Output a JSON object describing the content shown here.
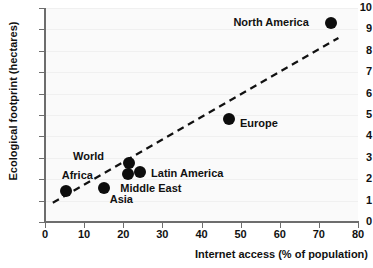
{
  "chart_data": {
    "type": "scatter",
    "title": "",
    "xlabel": "Internet access (% of population)",
    "ylabel": "Ecological footprint (hectares)",
    "xlim": [
      0,
      80
    ],
    "ylim": [
      0,
      10
    ],
    "xticks": [
      0,
      10,
      20,
      30,
      40,
      50,
      60,
      70,
      80
    ],
    "yticks": [
      0,
      1,
      2,
      3,
      4,
      5,
      6,
      7,
      8,
      9,
      10
    ],
    "grid": "horizontal-faint",
    "legend": "none",
    "point_color": "#0d0d0d",
    "trendline": {
      "style": "dashed",
      "color": "#111111",
      "x": [
        2.0,
        75.0
      ],
      "y": [
        0.9,
        8.6
      ]
    },
    "points": [
      {
        "name": "Africa",
        "x": 5.3,
        "y": 1.45,
        "label_dx": -4,
        "label_dy": -16,
        "label_align": "left"
      },
      {
        "name": "Asia",
        "x": 15.0,
        "y": 1.6,
        "label_dx": 6,
        "label_dy": 11,
        "label_align": "left"
      },
      {
        "name": "World",
        "x": 21.5,
        "y": 2.75,
        "label_dx": -56,
        "label_dy": -7,
        "label_align": "left"
      },
      {
        "name": "Middle East",
        "x": 21.3,
        "y": 2.25,
        "label_dx": -8,
        "label_dy": 14,
        "label_align": "left"
      },
      {
        "name": "Latin America",
        "x": 24.3,
        "y": 2.35,
        "label_dx": 11,
        "label_dy": 1,
        "label_align": "left"
      },
      {
        "name": "Europe",
        "x": 47.0,
        "y": 4.8,
        "label_dx": 11,
        "label_dy": 4,
        "label_align": "left"
      },
      {
        "name": "North America",
        "x": 73.2,
        "y": 9.3,
        "label_dx": -98,
        "label_dy": -1,
        "label_align": "left"
      }
    ]
  }
}
